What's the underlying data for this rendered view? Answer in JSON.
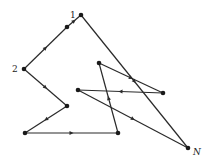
{
  "diagram": {
    "type": "path-graph",
    "colors": {
      "line": "#2a2a2a",
      "node": "#1a1a1a",
      "background": "#ffffff"
    },
    "nodes": [
      {
        "id": "1",
        "x": 81,
        "y": 15,
        "label": "1"
      },
      {
        "id": "a",
        "x": 67,
        "y": 27,
        "label": ""
      },
      {
        "id": "2",
        "x": 24,
        "y": 69,
        "label": "2"
      },
      {
        "id": "b",
        "x": 67,
        "y": 106,
        "label": ""
      },
      {
        "id": "c",
        "x": 25,
        "y": 133,
        "label": ""
      },
      {
        "id": "d",
        "x": 118,
        "y": 133,
        "label": ""
      },
      {
        "id": "e",
        "x": 99,
        "y": 63,
        "label": ""
      },
      {
        "id": "f",
        "x": 163,
        "y": 93,
        "label": ""
      },
      {
        "id": "g",
        "x": 78,
        "y": 90,
        "label": ""
      },
      {
        "id": "N",
        "x": 188,
        "y": 148,
        "label": "N"
      }
    ],
    "edges": [
      {
        "from": "a",
        "to": "1"
      },
      {
        "from": "2",
        "to": "a"
      },
      {
        "from": "2",
        "to": "b"
      },
      {
        "from": "b",
        "to": "c"
      },
      {
        "from": "c",
        "to": "d"
      },
      {
        "from": "d",
        "to": "e"
      },
      {
        "from": "e",
        "to": "f"
      },
      {
        "from": "f",
        "to": "g"
      },
      {
        "from": "g",
        "to": "N"
      },
      {
        "from": "1",
        "to": "N"
      }
    ],
    "labels": {
      "node_1": "1",
      "node_2": "2",
      "node_N": "N"
    }
  }
}
